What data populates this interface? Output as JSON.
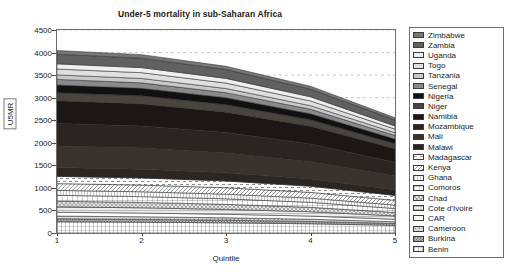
{
  "chart_data": {
    "type": "area",
    "title": "Under-5 mortality in sub-Saharan Africa",
    "xlabel": "Quintlie",
    "ylabel": "U5MR",
    "xlim": [
      1,
      5
    ],
    "ylim": [
      0,
      4500
    ],
    "x": [
      1,
      2,
      3,
      4,
      5
    ],
    "xticks": [
      "1",
      "2",
      "3",
      "4",
      "5"
    ],
    "yticks": [
      "0",
      "500",
      "1000",
      "1500",
      "2000",
      "2500",
      "3000",
      "3500",
      "4000",
      "4500"
    ],
    "grid": "horizontal-dashed",
    "legend_position": "right-outside",
    "stacked": true,
    "stack_order_bottom_to_top": [
      "Benin",
      "Burkina",
      "Cameroon",
      "CAR",
      "Cote d'Ivoire",
      "Chad",
      "Comoros",
      "Ghana",
      "Kenya",
      "Madagascar",
      "Malawi",
      "Mali",
      "Mozambique",
      "Namibia",
      "Niger",
      "Nigeria",
      "Senegal",
      "Tanzania",
      "Togo",
      "Uganda",
      "Zambia",
      "Zimbabwe"
    ],
    "series": [
      {
        "name": "Benin",
        "fill": "#ffffff",
        "pattern": "grid-fine",
        "values": [
          250,
          240,
          225,
          205,
          170
        ]
      },
      {
        "name": "Burkina",
        "fill": "#b8b8b8",
        "pattern": "dots-dense",
        "values": [
          65,
          62,
          58,
          52,
          42
        ]
      },
      {
        "name": "Cameroon",
        "fill": "#d8d8d8",
        "pattern": "dots-sparse",
        "values": [
          60,
          58,
          54,
          48,
          38
        ]
      },
      {
        "name": "CAR",
        "fill": "#ffffff",
        "pattern": "solid-light",
        "values": [
          85,
          82,
          78,
          70,
          55
        ]
      },
      {
        "name": "Cote d'Ivoire",
        "fill": "#ededed",
        "pattern": "hlines",
        "values": [
          120,
          116,
          108,
          96,
          74
        ]
      },
      {
        "name": "Chad",
        "fill": "#e4e4e4",
        "pattern": "checks",
        "values": [
          125,
          120,
          112,
          98,
          76
        ]
      },
      {
        "name": "Comoros",
        "fill": "#ffffff",
        "pattern": "grid-coarse",
        "values": [
          130,
          128,
          122,
          110,
          88
        ]
      },
      {
        "name": "Ghana",
        "fill": "#fafafa",
        "pattern": "vlines",
        "values": [
          110,
          108,
          104,
          94,
          76
        ]
      },
      {
        "name": "Kenya",
        "fill": "#ffffff",
        "pattern": "diag-fine",
        "values": [
          150,
          148,
          142,
          128,
          104
        ]
      },
      {
        "name": "Madagascar",
        "fill": "#ffffff",
        "pattern": "dashes",
        "values": [
          160,
          158,
          150,
          136,
          110
        ]
      },
      {
        "name": "Malawi",
        "fill": "#2b2622",
        "pattern": "solid",
        "values": [
          195,
          192,
          180,
          160,
          128
        ]
      },
      {
        "name": "Mali",
        "fill": "#3a332d",
        "pattern": "solid",
        "values": [
          480,
          470,
          438,
          382,
          300
        ]
      },
      {
        "name": "Mozambique",
        "fill": "#2a2520",
        "pattern": "solid",
        "values": [
          500,
          492,
          456,
          396,
          308
        ]
      },
      {
        "name": "Namibia",
        "fill": "#1a1714",
        "pattern": "solid",
        "values": [
          500,
          490,
          452,
          392,
          300
        ]
      },
      {
        "name": "Niger",
        "fill": "#4a443e",
        "pattern": "solid",
        "values": [
          180,
          176,
          164,
          142,
          110
        ]
      },
      {
        "name": "Nigeria",
        "fill": "#111111",
        "pattern": "solid",
        "values": [
          170,
          166,
          154,
          134,
          104
        ]
      },
      {
        "name": "Senegal",
        "fill": "#8a8a8a",
        "pattern": "solid",
        "values": [
          125,
          122,
          114,
          100,
          78
        ]
      },
      {
        "name": "Tanzania",
        "fill": "#c9c9c9",
        "pattern": "solid",
        "values": [
          100,
          98,
          92,
          80,
          62
        ]
      },
      {
        "name": "Togo",
        "fill": "#e0e0e0",
        "pattern": "solid",
        "values": [
          130,
          128,
          120,
          104,
          80
        ]
      },
      {
        "name": "Uganda",
        "fill": "#efefef",
        "pattern": "solid",
        "values": [
          115,
          112,
          104,
          92,
          70
        ]
      },
      {
        "name": "Zambia",
        "fill": "#606060",
        "pattern": "solid",
        "values": [
          215,
          210,
          196,
          170,
          132
        ]
      },
      {
        "name": "Zimbabwe",
        "fill": "#777777",
        "pattern": "solid",
        "values": [
          80,
          78,
          72,
          64,
          50
        ]
      }
    ],
    "legend_entries_top_to_bottom": [
      {
        "label": "Zimbabwe",
        "fill": "#777777",
        "pattern": "solid"
      },
      {
        "label": "Zambia",
        "fill": "#606060",
        "pattern": "solid"
      },
      {
        "label": "Uganda",
        "fill": "#efefef",
        "pattern": "solid"
      },
      {
        "label": "Togo",
        "fill": "#e0e0e0",
        "pattern": "solid"
      },
      {
        "label": "Tanzania",
        "fill": "#c9c9c9",
        "pattern": "solid"
      },
      {
        "label": "Senegal",
        "fill": "#8a8a8a",
        "pattern": "solid"
      },
      {
        "label": "Nigeria",
        "fill": "#111111",
        "pattern": "solid"
      },
      {
        "label": "Niger",
        "fill": "#4a443e",
        "pattern": "solid"
      },
      {
        "label": "Namibia",
        "fill": "#1a1714",
        "pattern": "solid"
      },
      {
        "label": "Mozambique",
        "fill": "#2a2520",
        "pattern": "solid"
      },
      {
        "label": "Mali",
        "fill": "#3a332d",
        "pattern": "solid"
      },
      {
        "label": "Malawi",
        "fill": "#2b2622",
        "pattern": "solid"
      },
      {
        "label": "Madagascar",
        "fill": "#ffffff",
        "pattern": "dashes"
      },
      {
        "label": "Kenya",
        "fill": "#ffffff",
        "pattern": "diag-fine"
      },
      {
        "label": "Ghana",
        "fill": "#fafafa",
        "pattern": "vlines"
      },
      {
        "label": "Comoros",
        "fill": "#ffffff",
        "pattern": "grid-coarse"
      },
      {
        "label": "Chad",
        "fill": "#e4e4e4",
        "pattern": "checks"
      },
      {
        "label": "Cote d'Ivoire",
        "fill": "#ededed",
        "pattern": "hlines"
      },
      {
        "label": "CAR",
        "fill": "#ffffff",
        "pattern": "solid-light"
      },
      {
        "label": "Cameroon",
        "fill": "#d8d8d8",
        "pattern": "dots-sparse"
      },
      {
        "label": "Burkina",
        "fill": "#b8b8b8",
        "pattern": "dots-dense"
      },
      {
        "label": "Benin",
        "fill": "#ffffff",
        "pattern": "grid-fine"
      }
    ]
  }
}
